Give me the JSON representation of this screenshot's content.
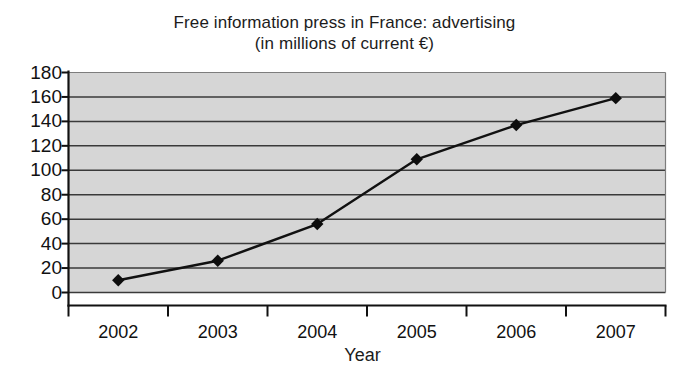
{
  "chart_data": {
    "type": "line",
    "title": "Free information press in France: advertising (in millions of current €)",
    "title_lines": [
      "Free information press in France: advertising",
      "(in millions of current €)"
    ],
    "xlabel": "Year",
    "ylabel": "",
    "categories": [
      "2002",
      "2003",
      "2004",
      "2005",
      "2006",
      "2007"
    ],
    "values": [
      10,
      26,
      56,
      109,
      137,
      159
    ],
    "series": [
      {
        "name": "Advertising revenue",
        "values": [
          10,
          26,
          56,
          109,
          137,
          159
        ]
      }
    ],
    "ylim": [
      0,
      180
    ],
    "ytick_step": 20,
    "yticks": [
      "180",
      "160",
      "140",
      "120",
      "100",
      "80",
      "60",
      "40",
      "20",
      "0"
    ],
    "ytick_values": [
      180,
      160,
      140,
      120,
      100,
      80,
      60,
      40,
      20,
      0
    ],
    "grid": "horizontal",
    "legend": "none",
    "units": "millions of current €",
    "marker": "diamond",
    "colors": {
      "plot_background": "#d2d2d2",
      "gridline": "#3a3a3a",
      "axis": "#111111",
      "series_line": "#111111",
      "marker_fill": "#0d0d0d",
      "text": "#1c1c1c",
      "page_background": "#ffffff"
    }
  }
}
